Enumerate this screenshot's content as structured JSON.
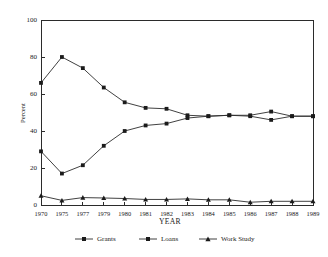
{
  "chart_data": {
    "type": "line",
    "title": "",
    "xlabel": "YEAR",
    "ylabel": "Percent",
    "categories": [
      "1970",
      "1975",
      "1977",
      "1979",
      "1980",
      "1981",
      "1982",
      "1983",
      "1984",
      "1985",
      "1986",
      "1987",
      "1988",
      "1989"
    ],
    "xtick_labels": [
      "1970",
      "1975",
      "1977",
      "1979",
      "1980",
      "1981",
      "1982",
      "1983",
      "1984",
      "1985",
      "1986",
      "1987",
      "1988",
      "1989"
    ],
    "ytick_labels": [
      "0",
      "20",
      "40",
      "60",
      "80",
      "100"
    ],
    "yticks": [
      0,
      20,
      40,
      60,
      80,
      100
    ],
    "ylim": [
      0,
      100
    ],
    "grid": false,
    "legend_position": "bottom",
    "series": [
      {
        "name": "Grants",
        "marker": "square",
        "color": "#1b1b1b",
        "values": [
          66,
          80,
          74,
          63.5,
          55.5,
          52.5,
          52,
          48.5,
          48,
          48.5,
          48,
          46,
          48,
          48
        ]
      },
      {
        "name": "Loans",
        "marker": "square",
        "color": "#1b1b1b",
        "values": [
          29,
          17,
          21.5,
          32,
          40,
          43,
          44,
          47,
          48,
          48.5,
          48.5,
          50.5,
          48,
          48
        ]
      },
      {
        "name": "Work Study",
        "marker": "triangle",
        "color": "#1b1b1b",
        "values": [
          5,
          2.5,
          4,
          3.8,
          3.5,
          3,
          3,
          3.3,
          2.8,
          2.8,
          1.5,
          2,
          2,
          2
        ]
      }
    ]
  },
  "legend": {
    "items": [
      {
        "label": "Grants"
      },
      {
        "label": "Loans"
      },
      {
        "label": "Work Study"
      }
    ]
  }
}
